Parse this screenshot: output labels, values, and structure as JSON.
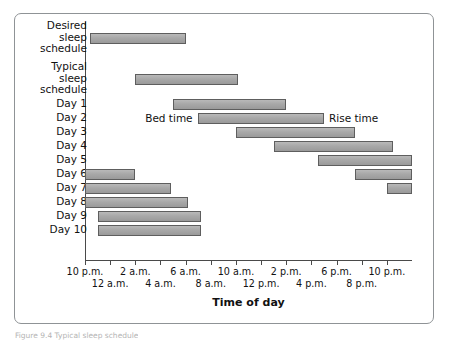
{
  "figure": {
    "caption": "Figure 9.4   Typical sleep schedule"
  },
  "chart_data": {
    "type": "bar",
    "subtype": "gantt-horizontal-range",
    "title": "",
    "xlabel": "Time of day",
    "ylabel": "",
    "grid": false,
    "legend": "none",
    "x_axis": {
      "unit": "hours from 10 p.m.",
      "xlim": [
        0,
        26
      ],
      "tick_interval_hours": 2,
      "tick_labels_row1": [
        "10 p.m.",
        "",
        "2 a.m.",
        "",
        "6 a.m.",
        "",
        "10 a.m.",
        "",
        "2 p.m.",
        "",
        "6 p.m.",
        "",
        "10 p.m."
      ],
      "tick_labels_row2": [
        "",
        "12 a.m.",
        "",
        "4 a.m.",
        "",
        "8 a.m.",
        "",
        "12 p.m.",
        "",
        "4 p.m.",
        "",
        "8 p.m.",
        ""
      ],
      "tick_labels_flat": [
        "10 p.m.",
        "12 a.m.",
        "2 a.m.",
        "4 a.m.",
        "6 a.m.",
        "8 a.m.",
        "10 a.m.",
        "12 p.m.",
        "2 p.m.",
        "4 p.m.",
        "6 p.m.",
        "8 p.m.",
        "10 p.m."
      ]
    },
    "categories": [
      "Desired\nsleep\nschedule",
      "Typical\nsleep\nschedule",
      "Day 1",
      "Day 2",
      "Day 3",
      "Day 4",
      "Day 5",
      "Day 6",
      "Day 7",
      "Day 8",
      "Day 9",
      "Day 10"
    ],
    "bar_color": "#a8a8a8",
    "bar_border_color": "#5e5e5e",
    "series": [
      {
        "name": "Sleep period",
        "bars": [
          {
            "row": "Desired sleep schedule",
            "start_hours": 0.4,
            "end_hours": 8.0,
            "start_label": "10:24 p.m.",
            "end_label": "6 a.m.",
            "segment": 1
          },
          {
            "row": "Typical sleep schedule",
            "start_hours": 4.0,
            "end_hours": 12.2,
            "start_label": "2 a.m.",
            "end_label": "10:12 a.m.",
            "segment": 1
          },
          {
            "row": "Day 1",
            "start_hours": 7.0,
            "end_hours": 16.0,
            "start_label": "5 a.m.",
            "end_label": "2 p.m.",
            "segment": 1
          },
          {
            "row": "Day 2",
            "start_hours": 9.0,
            "end_hours": 19.0,
            "start_label": "7 a.m.",
            "end_label": "5 p.m.",
            "segment": 1
          },
          {
            "row": "Day 3",
            "start_hours": 12.0,
            "end_hours": 21.5,
            "start_label": "10 a.m.",
            "end_label": "7:30 p.m.",
            "segment": 1
          },
          {
            "row": "Day 4",
            "start_hours": 15.0,
            "end_hours": 24.5,
            "start_label": "1 p.m.",
            "end_label": "10:30 p.m.",
            "segment": 1
          },
          {
            "row": "Day 5",
            "start_hours": 18.5,
            "end_hours": 26.0,
            "start_label": "4:30 p.m.",
            "end_label": "12 a.m.",
            "segment": 1
          },
          {
            "row": "Day 6",
            "start_hours": 21.5,
            "end_hours": 26.0,
            "start_label": "7:30 p.m.",
            "end_label": "12 a.m.",
            "segment": 1
          },
          {
            "row": "Day 6",
            "start_hours": 0.0,
            "end_hours": 4.0,
            "start_label": "10 p.m.",
            "end_label": "2 a.m.",
            "segment": 2
          },
          {
            "row": "Day 7",
            "start_hours": 24.0,
            "end_hours": 26.0,
            "start_label": "10 p.m.",
            "end_label": "12 a.m.",
            "segment": 1
          },
          {
            "row": "Day 7",
            "start_hours": 0.0,
            "end_hours": 6.8,
            "start_label": "10 p.m.",
            "end_label": "4:48 a.m.",
            "segment": 2
          },
          {
            "row": "Day 8",
            "start_hours": 0.0,
            "end_hours": 8.2,
            "start_label": "10 p.m.",
            "end_label": "6:12 a.m.",
            "segment": 1
          },
          {
            "row": "Day 9",
            "start_hours": 1.0,
            "end_hours": 9.2,
            "start_label": "11 p.m.",
            "end_label": "7:12 a.m.",
            "segment": 1
          },
          {
            "row": "Day 10",
            "start_hours": 1.0,
            "end_hours": 9.2,
            "start_label": "11 p.m.",
            "end_label": "7:12 a.m.",
            "segment": 1
          }
        ]
      }
    ],
    "annotations": [
      {
        "text": "Bed time",
        "anchor_row": "Day 2",
        "side": "left"
      },
      {
        "text": "Rise time",
        "anchor_row": "Day 2",
        "side": "right"
      }
    ]
  }
}
